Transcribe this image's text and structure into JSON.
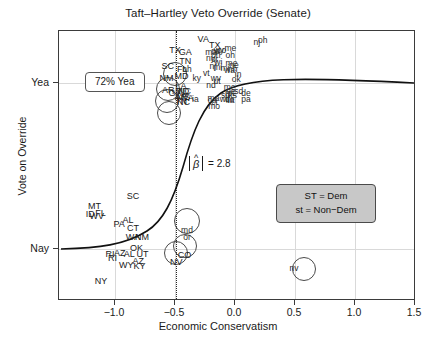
{
  "chart_data": {
    "type": "scatter",
    "title": "Taft–Hartley Veto Override (Senate)",
    "xlabel": "Economic Conservatism",
    "ylabel": "Vote on Override",
    "xlim": [
      -1.35,
      1.62
    ],
    "ylim": [
      -0.22,
      1.2
    ],
    "xticks": [
      -1.0,
      -0.5,
      0.0,
      0.5,
      1.0,
      1.5
    ],
    "xticklabels": [
      "−1.0",
      "−0.5",
      "0.0",
      "0.5",
      "1.0",
      "1.5"
    ],
    "yticks": [
      1.0,
      0.0
    ],
    "yticklabels": [
      "Yea",
      "Nay"
    ],
    "grid": true,
    "legend_position": "middle-right",
    "annotations": [
      {
        "name": "yea-percent-box",
        "text": "72% Yea",
        "x": -1.06,
        "y": 1.0
      },
      {
        "name": "beta-annotation",
        "text": "|β̂| = 2.8",
        "beta_value": "2.8",
        "x": -0.38,
        "y": 0.45
      },
      {
        "name": "cutpoint-line",
        "type": "vertical-dotted",
        "x": -0.365
      }
    ],
    "legend": {
      "line1": "ST = Dem",
      "line2": "st = Non−Dem"
    },
    "curve": {
      "name": "logistic-fit",
      "description": "logistic regression fitted curve",
      "beta_abs": 2.8
    },
    "points_yea": [
      {
        "label": "TX",
        "x": -0.385,
        "y": 1.1,
        "group": "dem",
        "circled": true
      },
      {
        "label": "SC",
        "x": -0.445,
        "y": 1.015,
        "group": "dem",
        "circled": true
      },
      {
        "label": "NM",
        "x": -0.455,
        "y": 0.955,
        "group": "dem",
        "circled": true
      },
      {
        "label": "AR",
        "x": -0.44,
        "y": 0.89,
        "group": "dem",
        "circled": true
      },
      {
        "label": "GA",
        "x": -0.3,
        "y": 1.09,
        "group": "dem"
      },
      {
        "label": "TN",
        "x": -0.3,
        "y": 1.04,
        "group": "dem"
      },
      {
        "label": "VA",
        "x": -0.15,
        "y": 1.16,
        "group": "dem"
      },
      {
        "label": "FL",
        "x": -0.325,
        "y": 1.0,
        "group": "dem"
      },
      {
        "label": "MD",
        "x": -0.33,
        "y": 0.965,
        "group": "dem"
      },
      {
        "label": "nh",
        "x": -0.285,
        "y": 1.0,
        "group": "nondem"
      },
      {
        "label": "ky",
        "x": -0.205,
        "y": 0.955,
        "group": "nondem"
      },
      {
        "label": "LA",
        "x": -0.335,
        "y": 0.91,
        "group": "dem"
      },
      {
        "label": "GA",
        "x": -0.385,
        "y": 0.875,
        "group": "dem"
      },
      {
        "label": "MD",
        "x": -0.325,
        "y": 0.885,
        "group": "dem"
      },
      {
        "label": "NC",
        "x": -0.305,
        "y": 0.885,
        "group": "dem"
      },
      {
        "label": "AR",
        "x": -0.335,
        "y": 0.855,
        "group": "dem"
      },
      {
        "label": "MS",
        "x": -0.315,
        "y": 0.855,
        "group": "dem"
      },
      {
        "label": "VA",
        "x": -0.275,
        "y": 0.85,
        "group": "dem"
      },
      {
        "label": "TN",
        "x": -0.335,
        "y": 0.83,
        "group": "dem"
      },
      {
        "label": "NC",
        "x": -0.315,
        "y": 0.825,
        "group": "dem"
      },
      {
        "label": "ia",
        "x": -0.215,
        "y": 0.845,
        "group": "nondem"
      },
      {
        "label": "TX",
        "x": -0.055,
        "y": 1.125,
        "group": "dem"
      },
      {
        "label": "ma",
        "x": -0.085,
        "y": 1.09,
        "group": "nondem"
      },
      {
        "label": "nn",
        "x": -0.045,
        "y": 1.095,
        "group": "nondem"
      },
      {
        "label": "wy",
        "x": -0.02,
        "y": 1.1,
        "group": "nondem"
      },
      {
        "label": "co",
        "x": 0.005,
        "y": 1.1,
        "group": "nondem"
      },
      {
        "label": "ny",
        "x": -0.09,
        "y": 1.06,
        "group": "nondem"
      },
      {
        "label": "oh",
        "x": -0.045,
        "y": 1.075,
        "group": "nondem"
      },
      {
        "label": "or",
        "x": -0.055,
        "y": 1.055,
        "group": "nondem"
      },
      {
        "label": "wi",
        "x": -0.025,
        "y": 1.035,
        "group": "nondem"
      },
      {
        "label": "me",
        "x": 0.075,
        "y": 1.11,
        "group": "nondem"
      },
      {
        "label": "oh",
        "x": 0.075,
        "y": 1.075,
        "group": "nondem"
      },
      {
        "label": "nj",
        "x": -0.07,
        "y": 1.015,
        "group": "nondem"
      },
      {
        "label": "mi",
        "x": -0.03,
        "y": 1.01,
        "group": "nondem"
      },
      {
        "label": "mi",
        "x": 0.03,
        "y": 1.005,
        "group": "nondem"
      },
      {
        "label": "me",
        "x": 0.085,
        "y": 1.03,
        "group": "nondem"
      },
      {
        "label": "ne",
        "x": 0.105,
        "y": 1.02,
        "group": "nondem"
      },
      {
        "label": "wa",
        "x": 0.07,
        "y": 0.995,
        "group": "nondem"
      },
      {
        "label": "nh",
        "x": 0.095,
        "y": 1.0,
        "group": "nondem"
      },
      {
        "label": "in",
        "x": 0.14,
        "y": 0.975,
        "group": "nondem"
      },
      {
        "label": "nj",
        "x": 0.295,
        "y": 1.14,
        "group": "nondem"
      },
      {
        "label": "oh",
        "x": 0.345,
        "y": 1.155,
        "group": "nondem"
      },
      {
        "label": "vt",
        "x": -0.125,
        "y": 0.98,
        "group": "nondem"
      },
      {
        "label": "wv",
        "x": -0.045,
        "y": 0.955,
        "group": "nondem"
      },
      {
        "label": "ut",
        "x": -0.035,
        "y": 0.935,
        "group": "nondem"
      },
      {
        "label": "nd",
        "x": -0.085,
        "y": 0.915,
        "group": "nondem"
      },
      {
        "label": "ok",
        "x": 0.125,
        "y": 0.945,
        "group": "nondem"
      },
      {
        "label": "me",
        "x": 0.07,
        "y": 0.905,
        "group": "nondem"
      },
      {
        "label": "ne",
        "x": 0.08,
        "y": 0.885,
        "group": "nondem"
      },
      {
        "label": "mt",
        "x": 0.07,
        "y": 0.875,
        "group": "nondem"
      },
      {
        "label": "ks",
        "x": 0.095,
        "y": 0.865,
        "group": "nondem"
      },
      {
        "label": "sd",
        "x": 0.145,
        "y": 0.885,
        "group": "nondem"
      },
      {
        "label": "de",
        "x": 0.205,
        "y": 0.875,
        "group": "nondem"
      },
      {
        "label": "sd",
        "x": 0.035,
        "y": 0.865,
        "group": "nondem"
      },
      {
        "label": "wi",
        "x": 0.02,
        "y": 0.84,
        "group": "nondem"
      },
      {
        "label": "il",
        "x": 0.055,
        "y": 0.835,
        "group": "nondem"
      },
      {
        "label": "de",
        "x": 0.07,
        "y": 0.84,
        "group": "nondem"
      },
      {
        "label": "ia",
        "x": 0.082,
        "y": 0.835,
        "group": "nondem"
      },
      {
        "label": "pa",
        "x": 0.205,
        "y": 0.84,
        "group": "nondem"
      },
      {
        "label": "ma",
        "x": -0.065,
        "y": 0.85,
        "group": "nondem"
      },
      {
        "label": "ca",
        "x": -0.075,
        "y": 0.835,
        "group": "nondem"
      },
      {
        "label": "ct",
        "x": -0.055,
        "y": 0.825,
        "group": "nondem"
      },
      {
        "label": "mo",
        "x": -0.06,
        "y": 0.805,
        "group": "nondem"
      }
    ],
    "points_nay": [
      {
        "label": "MT",
        "x": -1.055,
        "y": 0.28,
        "group": "dem"
      },
      {
        "label": "ID",
        "x": -1.09,
        "y": 0.235,
        "group": "dem"
      },
      {
        "label": "WV",
        "x": -1.035,
        "y": 0.225,
        "group": "dem"
      },
      {
        "label": "FL",
        "x": -1.005,
        "y": 0.245,
        "group": "dem"
      },
      {
        "label": "SC",
        "x": -0.735,
        "y": 0.33,
        "group": "dem"
      },
      {
        "label": "PA",
        "x": -0.85,
        "y": 0.185,
        "group": "dem"
      },
      {
        "label": "AL",
        "x": -0.775,
        "y": 0.205,
        "group": "dem"
      },
      {
        "label": "CT",
        "x": -0.735,
        "y": 0.165,
        "group": "dem"
      },
      {
        "label": "WA",
        "x": -0.735,
        "y": 0.115,
        "group": "dem"
      },
      {
        "label": "NM",
        "x": -0.66,
        "y": 0.115,
        "group": "dem"
      },
      {
        "label": "OK",
        "x": -0.705,
        "y": 0.06,
        "group": "dem"
      },
      {
        "label": "RI",
        "x": -0.925,
        "y": 0.025,
        "group": "dem"
      },
      {
        "label": "RI",
        "x": -0.905,
        "y": 0.005,
        "group": "dem"
      },
      {
        "label": "AZ",
        "x": -0.845,
        "y": 0.035,
        "group": "dem"
      },
      {
        "label": "AL",
        "x": -0.765,
        "y": 0.025,
        "group": "dem"
      },
      {
        "label": "UT",
        "x": -0.655,
        "y": 0.025,
        "group": "dem"
      },
      {
        "label": "AZ",
        "x": -0.69,
        "y": -0.01,
        "group": "dem"
      },
      {
        "label": "KY",
        "x": -0.68,
        "y": -0.035,
        "group": "dem"
      },
      {
        "label": "WY",
        "x": -0.79,
        "y": -0.03,
        "group": "dem"
      },
      {
        "label": "NY",
        "x": -1.0,
        "y": -0.115,
        "group": "dem"
      },
      {
        "label": "md",
        "x": -0.285,
        "y": 0.155,
        "group": "nondem",
        "circled": true
      },
      {
        "label": "or",
        "x": -0.285,
        "y": 0.115,
        "group": "nondem",
        "circled": true
      },
      {
        "label": "NV",
        "x": -0.375,
        "y": -0.015,
        "group": "dem",
        "circled": true
      },
      {
        "label": "CO",
        "x": -0.305,
        "y": 0.02,
        "group": "dem",
        "circled": true
      },
      {
        "label": "nv",
        "x": 0.605,
        "y": -0.045,
        "group": "nondem",
        "circled": true
      }
    ]
  },
  "colors": {
    "axis": "#3b3b3b",
    "grid": "#d9d9d9",
    "curve": "#111111",
    "legend_bg": "#c8c8c8",
    "text": "#1a1a1a"
  }
}
